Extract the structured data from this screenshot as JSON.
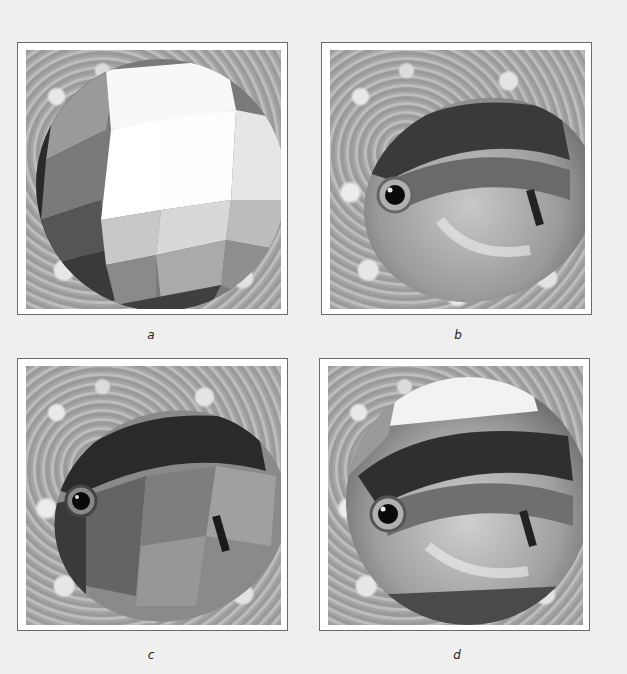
{
  "figure": {
    "panels": [
      {
        "id": "a",
        "label": "a",
        "content": "faceted flat-shaded sphere over cloud background"
      },
      {
        "id": "b",
        "label": "b",
        "content": "fish image texture-mapped onto sphere over cloud background"
      },
      {
        "id": "c",
        "label": "c",
        "content": "fish texture with faceted shading over cloud background"
      },
      {
        "id": "d",
        "label": "d",
        "content": "fish texture with environment reflection on sphere over cloud background"
      }
    ]
  },
  "colors": {
    "page_background": "#efefef",
    "panel_border": "#6a6a6a",
    "panel_fill": "#ffffff"
  }
}
